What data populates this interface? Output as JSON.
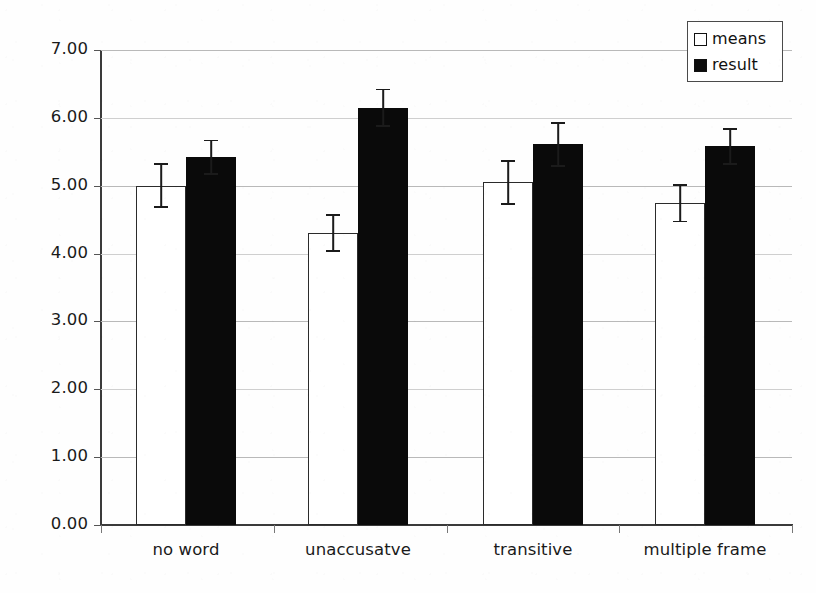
{
  "chart_data": {
    "type": "bar",
    "title": "",
    "xlabel": "",
    "ylabel": "Looking time (sec)",
    "categories": [
      "no word",
      "unaccusatve",
      "transitive",
      "multiple frame"
    ],
    "ylim": [
      0,
      7
    ],
    "ytick_step": 1,
    "ytick_labels": [
      "0.00",
      "1.00",
      "2.00",
      "3.00",
      "4.00",
      "5.00",
      "6.00",
      "7.00"
    ],
    "grid": "horizontal",
    "legend_position": "top-right",
    "series": [
      {
        "name": "means",
        "fill": "#ffffff",
        "edge": "#2b2b2b",
        "values": [
          5.0,
          4.3,
          5.05,
          4.74
        ],
        "errors": [
          0.33,
          0.28,
          0.33,
          0.28
        ]
      },
      {
        "name": "result",
        "fill": "#0a0a0a",
        "edge": "#0a0a0a",
        "values": [
          5.42,
          6.15,
          5.61,
          5.58
        ],
        "errors": [
          0.26,
          0.28,
          0.33,
          0.27
        ]
      }
    ]
  },
  "legend": {
    "items": [
      {
        "label": "means",
        "swatch": "open-square-swatch"
      },
      {
        "label": "result",
        "swatch": "filled-square-swatch"
      }
    ]
  },
  "axes": {
    "y_title": "Looking time (sec)"
  }
}
